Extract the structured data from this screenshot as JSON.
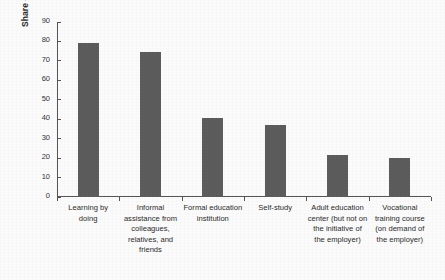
{
  "chart_data": {
    "type": "bar",
    "title": "",
    "subtitle": "",
    "xlabel": "",
    "ylabel": "Share of methods used (%)",
    "ylim": [
      0,
      90
    ],
    "yticks": [
      0,
      10,
      20,
      30,
      40,
      50,
      60,
      70,
      80,
      90
    ],
    "grid": false,
    "legend": null,
    "bar_color": "#5c5c5c",
    "background_color": "#fbfbfb",
    "axis_color": "#555555",
    "categories": [
      "Learning by doing",
      "Informal assistance from colleagues, relatives, and friends",
      "Formal education institution",
      "Self-study",
      "Adult education center (but not on the initiative of the employer)",
      "Vocational training course (on demand of the employer)"
    ],
    "values": [
      79,
      74.5,
      40.5,
      37,
      21.5,
      20
    ],
    "series": [
      {
        "name": "Share of methods used (%)",
        "values": [
          79,
          74.5,
          40.5,
          37,
          21.5,
          20
        ]
      }
    ]
  }
}
